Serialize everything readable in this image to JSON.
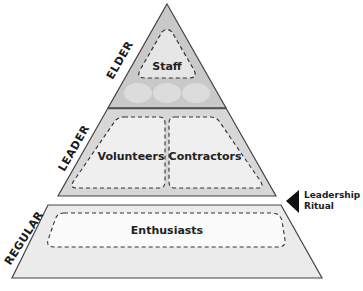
{
  "diagram": {
    "type": "pyramid",
    "tiers": [
      {
        "label": "ELDER",
        "groups": [
          "Staff"
        ],
        "placeholders": 3
      },
      {
        "label": "LEADER",
        "groups": [
          "Volunteers",
          "Contractors"
        ]
      },
      {
        "label": "REGULAR",
        "groups": [
          "Enthusiasts"
        ]
      }
    ],
    "transition": {
      "label_line1": "Leadership",
      "label_line2": "Ritual",
      "between": [
        "LEADER",
        "REGULAR"
      ]
    }
  },
  "colors": {
    "elder_fill": "#c9c9c9",
    "leader_fill": "#d7d7d7",
    "leader_inner": "#efefef",
    "regular_fill": "#ebebeb",
    "regular_inner": "#fbfbfb",
    "outline": "#444444",
    "arrow": "#111111"
  }
}
